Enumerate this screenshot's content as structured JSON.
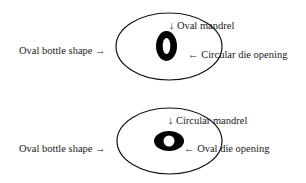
{
  "diagrams": [
    {
      "bottle_label": "Oval bottle shape →",
      "mandrel_label": "↓ Oval mandrel",
      "die_label": "← Circular die opening",
      "mandrel_shape": "oval",
      "die_shape": "circular"
    },
    {
      "bottle_label": "Oval bottle shape →",
      "mandrel_label": "↓ Circular mandrel",
      "die_label": "← Oval die opening",
      "mandrel_shape": "circular",
      "die_shape": "oval"
    }
  ],
  "colors": {
    "stroke": "#111111",
    "fill_dark": "#000000",
    "background": "#ffffff"
  }
}
